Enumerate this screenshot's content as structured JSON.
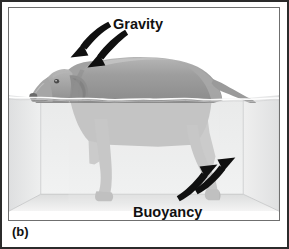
{
  "figure": {
    "panel_label": "(b)",
    "annotations": [
      {
        "name": "gravity",
        "label": "Gravity",
        "direction": "down-left",
        "arrow_count": 2
      },
      {
        "name": "buoyancy",
        "label": "Buoyancy",
        "direction": "up-right",
        "arrow_count": 2
      }
    ],
    "scene": {
      "subject": "dog",
      "container": "water-tank",
      "waterline_y": 97,
      "description_parts": [
        "dog-head",
        "dog-body",
        "dog-tail",
        "dog-front-leg-near",
        "dog-front-leg-far",
        "dog-hind-leg-near",
        "dog-hind-leg-far"
      ]
    },
    "colors": {
      "outer_border": "#2b2b2b",
      "illustration_border": "#6f6f6f",
      "background": "#ffffff",
      "dog_body": "#9b9b9b",
      "dog_body_highlight": "#b4b4b4",
      "dog_body_shadow": "#888888",
      "dog_submerged": "#bdbdbd",
      "dog_dark_detail": "#6a6a6a",
      "water_fill": "#ededee",
      "water_wall": "#e3e4e5",
      "tank_floor": "#e8e8e8",
      "tank_edge": "#c8c9ca",
      "arrow": "#101010",
      "label_text": "#111111"
    }
  }
}
